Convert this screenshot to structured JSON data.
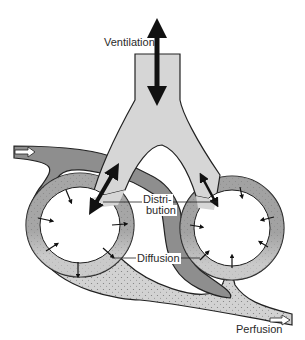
{
  "diagram": {
    "labels": {
      "ventilation": "Ventilation",
      "distribution_line1": "Distri-",
      "distribution_line2": "bution",
      "diffusion": "Diffusion",
      "perfusion": "Perfusion"
    },
    "colors": {
      "airway": "#d6d6d6",
      "venous_blood": "#8c8c8c",
      "arterial_blood": "#cfcfcf",
      "outline": "#222222",
      "arrow": "#111111",
      "background": "#ffffff"
    }
  }
}
